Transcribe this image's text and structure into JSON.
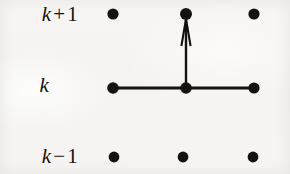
{
  "figure": {
    "background_color": "#f6f5f3",
    "ink_color": "#15130f",
    "width": 290,
    "height": 174
  },
  "row_labels": [
    {
      "name": "row-label-k-plus-1",
      "variable": "k",
      "operator": "+",
      "number": "1",
      "text": "k + 1",
      "y": 14
    },
    {
      "name": "row-label-k",
      "variable": "k",
      "operator": "",
      "number": "",
      "text": "k",
      "y": 85
    },
    {
      "name": "row-label-k-minus-1",
      "variable": "k",
      "operator": "−",
      "number": "1",
      "text": "k − 1",
      "y": 156
    }
  ],
  "lattice": {
    "columns_x": [
      113,
      185,
      254
    ],
    "rows_y": [
      14,
      88,
      157
    ],
    "dot_radius": 5.6,
    "dot_color": "#14120e",
    "points": [
      {
        "name": "lattice-point-top-left",
        "row": "k + 1",
        "column": 0,
        "cx": 113,
        "cy": 14
      },
      {
        "name": "lattice-point-top-center",
        "row": "k + 1",
        "column": 1,
        "cx": 186,
        "cy": 14
      },
      {
        "name": "lattice-point-top-right",
        "row": "k + 1",
        "column": 2,
        "cx": 254,
        "cy": 14
      },
      {
        "name": "lattice-point-middle-left",
        "row": "k",
        "column": 0,
        "cx": 113,
        "cy": 88
      },
      {
        "name": "lattice-point-middle-center",
        "row": "k",
        "column": 1,
        "cx": 186,
        "cy": 88
      },
      {
        "name": "lattice-point-middle-right",
        "row": "k",
        "column": 2,
        "cx": 254,
        "cy": 88
      },
      {
        "name": "lattice-point-bottom-left",
        "row": "k − 1",
        "column": 0,
        "cx": 114,
        "cy": 157
      },
      {
        "name": "lattice-point-bottom-center",
        "row": "k − 1",
        "column": 1,
        "cx": 183,
        "cy": 157
      },
      {
        "name": "lattice-point-bottom-right",
        "row": "k − 1",
        "column": 2,
        "cx": 253,
        "cy": 157
      }
    ],
    "horizontal_bond": {
      "name": "horizontal-bond-line",
      "x1": 113,
      "y1": 88,
      "x2": 254,
      "y2": 88,
      "stroke_width": 3.2,
      "color": "#14120e"
    },
    "vertical_arrow": {
      "name": "vertical-hop-arrow",
      "x1": 186,
      "y1": 88,
      "x2": 186,
      "y2": 19,
      "stroke_width": 2.4,
      "color": "#14120e",
      "head_half_width": 4.6,
      "head_length": 27,
      "direction": "up"
    }
  }
}
